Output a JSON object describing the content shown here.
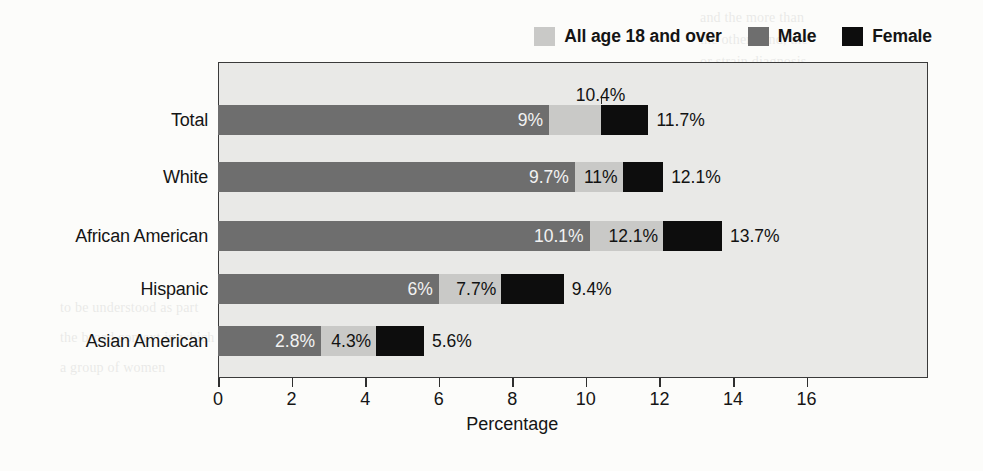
{
  "legend": {
    "items": [
      {
        "label": "All age 18 and over",
        "color": "#c9c9c7",
        "key": "all"
      },
      {
        "label": "Male",
        "color": "#6e6e6e",
        "key": "male"
      },
      {
        "label": "Female",
        "color": "#0d0d0d",
        "key": "female"
      }
    ]
  },
  "chart_data": {
    "type": "bar",
    "orientation": "horizontal",
    "title": "",
    "xlabel": "Percentage",
    "ylabel": "",
    "xlim": [
      0,
      19.3
    ],
    "xticks": [
      0,
      2,
      4,
      6,
      8,
      10,
      12,
      14,
      16
    ],
    "xtick_labels": [
      "0",
      "2",
      "4",
      "6",
      "8",
      "10",
      "12",
      "14",
      "16"
    ],
    "grid": false,
    "legend_position": "top-right",
    "categories": [
      "Total",
      "White",
      "African American",
      "Hispanic",
      "Asian American"
    ],
    "series": [
      {
        "name": "All age 18 and over",
        "color": "#c9c9c7",
        "values": [
          10.4,
          11,
          12.1,
          7.7,
          4.3
        ]
      },
      {
        "name": "Male",
        "color": "#6e6e6e",
        "values": [
          9,
          9.7,
          10.1,
          6,
          2.8
        ]
      },
      {
        "name": "Female",
        "color": "#0d0d0d",
        "values": [
          11.7,
          12.1,
          13.7,
          9.4,
          5.6
        ]
      }
    ],
    "data_labels": {
      "male": [
        "9%",
        "9.7%",
        "10.1%",
        "6%",
        "2.8%"
      ],
      "all": [
        "10.4%",
        "11%",
        "12.1%",
        "7.7%",
        "4.3%"
      ],
      "female": [
        "11.7%",
        "12.1%",
        "13.7%",
        "9.4%",
        "5.6%"
      ]
    },
    "rows": [
      {
        "category": "Total",
        "male": 9,
        "all": 10.4,
        "female": 11.7,
        "male_label": "9%",
        "all_label": "10.4%",
        "female_label": "11.7%",
        "all_label_above": true
      },
      {
        "category": "White",
        "male": 9.7,
        "all": 11,
        "female": 12.1,
        "male_label": "9.7%",
        "all_label": "11%",
        "female_label": "12.1%",
        "all_label_above": false
      },
      {
        "category": "African American",
        "male": 10.1,
        "all": 12.1,
        "female": 13.7,
        "male_label": "10.1%",
        "all_label": "12.1%",
        "female_label": "13.7%",
        "all_label_above": false
      },
      {
        "category": "Hispanic",
        "male": 6,
        "all": 7.7,
        "female": 9.4,
        "male_label": "6%",
        "all_label": "7.7%",
        "female_label": "9.4%",
        "all_label_above": false
      },
      {
        "category": "Asian American",
        "male": 2.8,
        "all": 4.3,
        "female": 5.6,
        "male_label": "2.8%",
        "all_label": "4.3%",
        "female_label": "5.6%",
        "all_label_above": false
      }
    ]
  },
  "page_bleed": [
    {
      "text": "and   the   more   than",
      "x": 700,
      "y": 10,
      "hd": false
    },
    {
      "text": "the  other  hand,  the",
      "x": 700,
      "y": 32,
      "hd": false
    },
    {
      "text": "or  strain  diagnosis.",
      "x": 700,
      "y": 54,
      "hd": false
    },
    {
      "text": "es of Depression",
      "x": 700,
      "y": 118,
      "hd": true
    },
    {
      "text": "ajor  reason  for  these",
      "x": 700,
      "y": 148,
      "hd": false
    },
    {
      "text": "pare the  complex  factors",
      "x": 700,
      "y": 170,
      "hd": false
    },
    {
      "text": "the  depressive  experience",
      "x": 700,
      "y": 192,
      "hd": false
    },
    {
      "text": "ly.  The  levels  of  the  self",
      "x": 700,
      "y": 214,
      "hd": false
    },
    {
      "text": "nd  the  racial  being  of  the",
      "x": 700,
      "y": 236,
      "hd": false
    },
    {
      "text": "chologic  perspectives",
      "x": 700,
      "y": 268,
      "hd": false
    },
    {
      "text": "can  hold  that  individuals",
      "x": 700,
      "y": 300,
      "hd": false
    },
    {
      "text": "to  be  understood  as  part",
      "x": 60,
      "y": 300,
      "hd": false
    },
    {
      "text": "the  broad  context  in  which",
      "x": 60,
      "y": 330,
      "hd": false
    },
    {
      "text": "a  group  of  women",
      "x": 60,
      "y": 360,
      "hd": false
    }
  ]
}
